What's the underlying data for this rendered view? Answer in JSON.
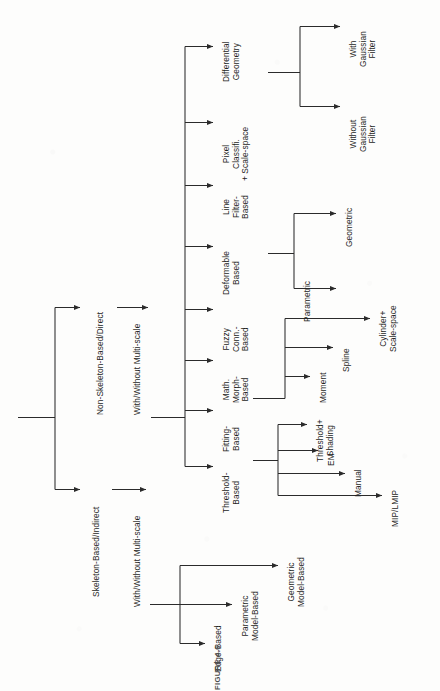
{
  "figure": {
    "caption": "FIGURE 4.6",
    "line_color": "#2b2b2b",
    "text_color": "#1d1d1d",
    "background": "#fdfdfc",
    "orientation": "rotated-90-ccw"
  },
  "tree": {
    "root_children": [
      "Non-Skeleton-Based/Direct",
      "Skeleton-Based/Indirect"
    ],
    "nodes": {
      "non_skeleton": {
        "label": "Non-Skeleton-Based/Direct",
        "child": "With/Without Multi-scale"
      },
      "non_skeleton_multiscale": {
        "label": "With/Without Multi-scale",
        "children": [
          "Differential\nGeometry",
          "Pixel\nClassifi.\n+ Scale-space",
          "Line\nFilter-\nBased",
          "Deformable\nBased",
          "Fuzzy\nConn.-\nBased",
          "Math.\nMorph-\nBased",
          "Fitting-\nBased",
          "Threshold-\nBased"
        ]
      },
      "differential_geometry": {
        "label": "Differential\nGeometry",
        "children": [
          "With\nGaussian\nFilter",
          "Without\nGaussian\nFilter"
        ]
      },
      "deformable_based": {
        "label": "Deformable\nBased",
        "children": [
          "Geometric",
          "Parametric"
        ]
      },
      "fitting_based": {
        "label": "Fitting-\nBased",
        "children": [
          "Cylinder+\nScale-space",
          "Spline",
          "Moment"
        ]
      },
      "threshold_based": {
        "label": "Threshold-\nBased",
        "children": [
          "Threshold+\nShading",
          "EM",
          "Manual",
          "MIP/LMIP"
        ]
      },
      "skeleton": {
        "label": "Skeleton-Based/Indirect",
        "child": "With/Without Multi-scale"
      },
      "skeleton_multiscale": {
        "label": "With/Without Multi-scale",
        "children": [
          "Geometric\nModel-Based",
          "Parametric\nModel-Based",
          "Edge-Based"
        ]
      }
    }
  },
  "labels": {
    "non_skeleton_based_direct": "Non-Skeleton-Based/Direct",
    "with_without_multiscale_top": "With/Without Multi-scale",
    "differential_geometry": "Differential\nGeometry",
    "pixel_classification": "Pixel\nClassifi.\n+ Scale-space",
    "line_filter_based": "Line\nFilter-\nBased",
    "deformable_based": "Deformable\nBased",
    "fuzzy_conn_based": "Fuzzy\nConn.-\nBased",
    "math_morph_based": "Math.\nMorph-\nBased",
    "fitting_based": "Fitting-\nBased",
    "threshold_based": "Threshold-\nBased",
    "with_gaussian_filter": "With\nGaussian\nFilter",
    "without_gaussian_filter": "Without\nGaussian\nFilter",
    "geometric": "Geometric",
    "parametric": "Parametric",
    "cylinder_scale_space": "Cylinder+\nScale-space",
    "spline": "Spline",
    "moment": "Moment",
    "threshold_shading": "Threshold+\nShading",
    "em": "EM",
    "manual": "Manual",
    "mip_lmip": "MIP/LMIP",
    "skeleton_based_indirect": "Skeleton-Based/Indirect",
    "with_without_multiscale_bottom": "With/Without Multi-scale",
    "geometric_model_based": "Geometric\nModel-Based",
    "parametric_model_based": "Parametric\nModel-Based",
    "edge_based": "Edge-Based"
  }
}
